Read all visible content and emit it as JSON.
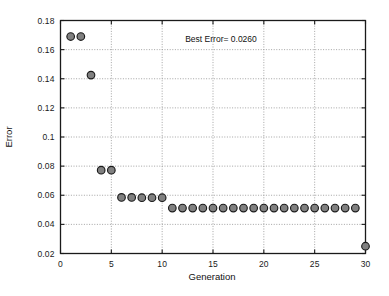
{
  "chart_data": {
    "type": "scatter",
    "title": "",
    "xlabel": "Generation",
    "ylabel": "Error",
    "xlim": [
      0,
      30
    ],
    "ylim": [
      0.02,
      0.18
    ],
    "xticks": [
      0,
      5,
      10,
      15,
      20,
      25,
      30
    ],
    "yticks": [
      0.02,
      0.04,
      0.06,
      0.08,
      0.1,
      0.12,
      0.14,
      0.16,
      0.18
    ],
    "xtick_labels": [
      "0",
      "5",
      "10",
      "15",
      "20",
      "25",
      "30"
    ],
    "ytick_labels": [
      "0.02",
      "0.04",
      "0.06",
      "0.08",
      "0.1",
      "0.12",
      "0.14",
      "0.16",
      "0.18"
    ],
    "grid": true,
    "legend": null,
    "annotations": [
      {
        "text": "Best Error= 0.0260",
        "x": 15,
        "y": 0.1705
      }
    ],
    "marker": {
      "shape": "circle",
      "fill_color": "#808080",
      "edge_color": "#1a1a1a",
      "size_px": 7.6
    },
    "x": [
      1,
      2,
      3,
      4,
      5,
      6,
      7,
      8,
      9,
      10,
      11,
      12,
      13,
      14,
      15,
      16,
      17,
      18,
      19,
      20,
      21,
      22,
      23,
      24,
      25,
      26,
      27,
      28,
      29,
      30
    ],
    "values": [
      0.169,
      0.169,
      0.1425,
      0.0772,
      0.0772,
      0.0585,
      0.0585,
      0.0583,
      0.0583,
      0.0583,
      0.0512,
      0.0512,
      0.0512,
      0.0512,
      0.0512,
      0.0512,
      0.0512,
      0.0512,
      0.0512,
      0.0512,
      0.0512,
      0.0512,
      0.0512,
      0.0512,
      0.0512,
      0.0512,
      0.0512,
      0.0512,
      0.0512,
      0.025
    ]
  },
  "axes": {
    "xlabel": "Generation",
    "ylabel": "Error"
  },
  "annotation": {
    "best_error_text": "Best Error= 0.0260"
  },
  "colors": {
    "marker_fill": "#808080",
    "marker_edge": "#1a1a1a",
    "grid": "#9a9a9a",
    "axis": "#1a1a1a",
    "background": "#ffffff"
  }
}
